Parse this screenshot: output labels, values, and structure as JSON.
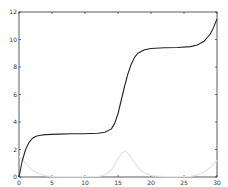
{
  "chart_data": {
    "type": "line",
    "title": "",
    "xlabel": "",
    "ylabel": "",
    "xlim": [
      0,
      30
    ],
    "ylim": [
      0,
      12
    ],
    "grid": false,
    "legend": null,
    "xticks": [
      0,
      5,
      10,
      15,
      20,
      25,
      30
    ],
    "yticks": [
      0,
      2,
      4,
      6,
      8,
      10,
      12
    ],
    "xtick_labels": [
      "0",
      "5",
      "10",
      "15",
      "20",
      "25",
      "30"
    ],
    "ytick_labels": [
      "0",
      "2",
      "4",
      "6",
      "8",
      "10",
      "12"
    ],
    "series": [
      {
        "name": "cumulative",
        "color": "#222222",
        "x": [
          0,
          0.5,
          1,
          1.5,
          2,
          2.5,
          3,
          4,
          5,
          6,
          8,
          10,
          12,
          13,
          14,
          14.5,
          15,
          15.5,
          16,
          16.5,
          17,
          17.5,
          18,
          19,
          20,
          22,
          24,
          26,
          27,
          28,
          29,
          29.5,
          30
        ],
        "y": [
          0,
          1.2,
          2.0,
          2.5,
          2.8,
          2.95,
          3.02,
          3.08,
          3.1,
          3.12,
          3.14,
          3.15,
          3.18,
          3.25,
          3.5,
          3.9,
          4.6,
          5.6,
          6.6,
          7.5,
          8.2,
          8.7,
          9.0,
          9.25,
          9.35,
          9.4,
          9.42,
          9.48,
          9.6,
          9.85,
          10.4,
          10.9,
          11.5
        ]
      },
      {
        "name": "rate",
        "color": "#e6e6e6",
        "x": [
          0,
          0.5,
          1,
          1.5,
          2,
          3,
          4,
          5,
          6,
          8,
          10,
          12,
          13,
          14,
          15,
          15.5,
          16,
          16.5,
          17,
          18,
          19,
          20,
          22,
          24,
          26,
          27,
          28,
          29,
          30
        ],
        "y": [
          1.5,
          1.3,
          1.0,
          0.75,
          0.5,
          0.25,
          0.1,
          0.04,
          0.02,
          0.02,
          0.02,
          0.05,
          0.15,
          0.5,
          1.3,
          1.7,
          1.9,
          1.75,
          1.4,
          0.7,
          0.3,
          0.1,
          0.03,
          0.02,
          0.05,
          0.15,
          0.35,
          0.7,
          1.2
        ]
      }
    ]
  }
}
